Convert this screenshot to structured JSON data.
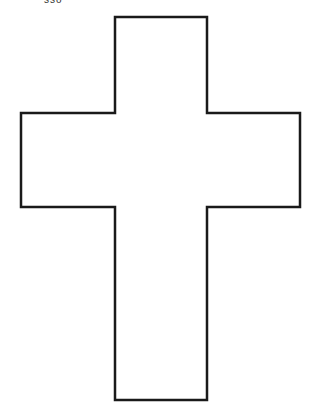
{
  "caption": "sso",
  "shape": {
    "name": "cross",
    "stroke": "#1a1a1a",
    "fill": "#ffffff",
    "stroke_width": 2.5,
    "points": [
      [
        115,
        17
      ],
      [
        207,
        17
      ],
      [
        207,
        113
      ],
      [
        300,
        113
      ],
      [
        300,
        207
      ],
      [
        207,
        207
      ],
      [
        207,
        400
      ],
      [
        115,
        400
      ],
      [
        115,
        207
      ],
      [
        21,
        207
      ],
      [
        21,
        113
      ],
      [
        115,
        113
      ]
    ]
  }
}
